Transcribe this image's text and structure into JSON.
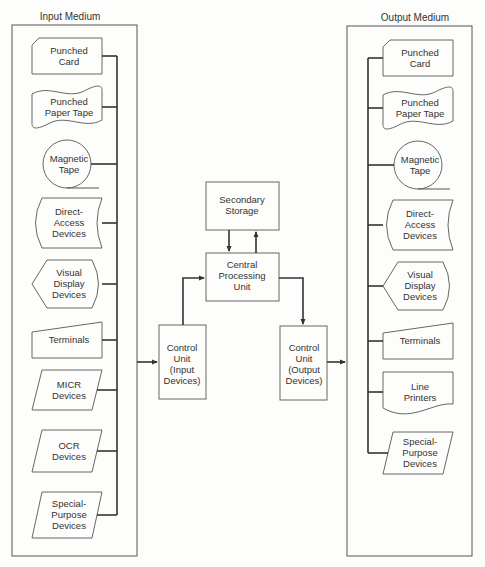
{
  "input_panel": {
    "title": "Input Medium",
    "items": [
      {
        "shape": "punched-card",
        "lines": [
          "Punched",
          "Card"
        ]
      },
      {
        "shape": "paper-tape",
        "lines": [
          "Punched",
          "Paper Tape"
        ]
      },
      {
        "shape": "magnetic-tape",
        "lines": [
          "Magnetic",
          "Tape"
        ]
      },
      {
        "shape": "direct-access",
        "lines": [
          "Direct-",
          "Access",
          "Devices"
        ]
      },
      {
        "shape": "display",
        "lines": [
          "Visual",
          "Display",
          "Devices"
        ]
      },
      {
        "shape": "manual-input",
        "lines": [
          "Terminals"
        ]
      },
      {
        "shape": "parallelogram",
        "lines": [
          "MICR",
          "Devices"
        ]
      },
      {
        "shape": "parallelogram",
        "lines": [
          "OCR",
          "Devices"
        ]
      },
      {
        "shape": "parallelogram",
        "lines": [
          "Special-",
          "Purpose",
          "Devices"
        ]
      }
    ]
  },
  "output_panel": {
    "title": "Output Medium",
    "items": [
      {
        "shape": "punched-card",
        "lines": [
          "Punched",
          "Card"
        ]
      },
      {
        "shape": "paper-tape",
        "lines": [
          "Punched",
          "Paper Tape"
        ]
      },
      {
        "shape": "magnetic-tape",
        "lines": [
          "Magnetic",
          "Tape"
        ]
      },
      {
        "shape": "direct-access",
        "lines": [
          "Direct-",
          "Access",
          "Devices"
        ]
      },
      {
        "shape": "display",
        "lines": [
          "Visual",
          "Display",
          "Devices"
        ]
      },
      {
        "shape": "manual-input",
        "lines": [
          "Terminals"
        ]
      },
      {
        "shape": "document",
        "lines": [
          "Line",
          "Printers"
        ]
      },
      {
        "shape": "parallelogram",
        "lines": [
          "Special-",
          "Purpose",
          "Devices"
        ]
      }
    ]
  },
  "center": {
    "secondary_storage": [
      "Secondary",
      "Storage"
    ],
    "cpu": [
      "Central",
      "Processing",
      "Unit"
    ],
    "control_input": [
      "Control",
      "Unit",
      "(Input",
      "Devices)"
    ],
    "control_output": [
      "Control",
      "Unit",
      "(Output",
      "Devices)"
    ]
  }
}
